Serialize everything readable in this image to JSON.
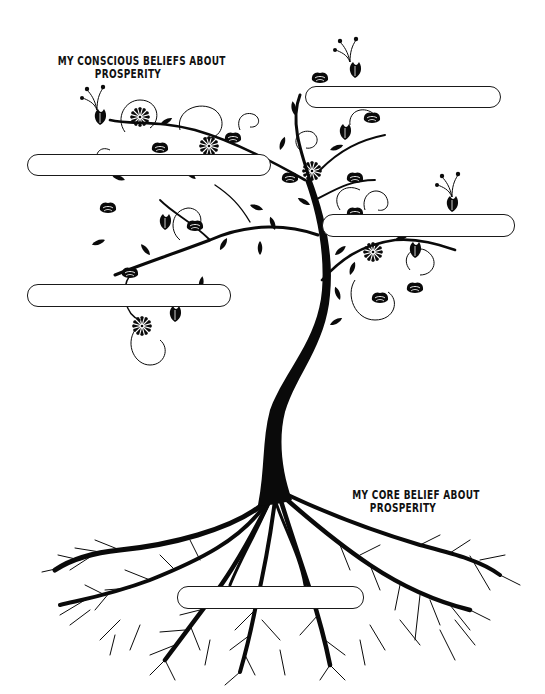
{
  "worksheet": {
    "title": "Prosperity Belief Tree",
    "headings": {
      "conscious": {
        "line1": "MY CONSCIOUS BELIEFS ABOUT",
        "line2": "PROSPERITY"
      },
      "core": {
        "line1": "MY CORE BELIEF ABOUT",
        "line2": "PROSPERITY"
      }
    },
    "conscious_belief_boxes": [
      {
        "id": "box-upper-right",
        "value": ""
      },
      {
        "id": "box-upper-left",
        "value": ""
      },
      {
        "id": "box-middle-right",
        "value": ""
      },
      {
        "id": "box-middle-left",
        "value": ""
      }
    ],
    "core_belief_box": {
      "id": "box-roots",
      "value": ""
    },
    "illustration": {
      "subject": "tree-with-flowers-and-roots",
      "ink_color": "#0a0a0a",
      "paper_color": "#ffffff"
    }
  }
}
